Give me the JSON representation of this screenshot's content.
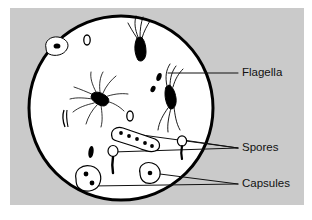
{
  "figure": {
    "background_color": "#cacaca",
    "field_color": "#ffffff",
    "ink_color": "#000000",
    "field": {
      "shape": "circle",
      "center_x": 121,
      "center_y": 108,
      "radius": 93,
      "stroke_width": 3
    }
  },
  "labels": [
    {
      "id": "flagella",
      "text": "Flagella",
      "x": 242,
      "y": 73,
      "leaders": [
        {
          "from_x": 238,
          "from_y": 73,
          "to_x": 168,
          "to_y": 73
        }
      ]
    },
    {
      "id": "spores",
      "text": "Spores",
      "x": 242,
      "y": 148,
      "leaders": [
        {
          "from_x": 238,
          "from_y": 148,
          "to_x": 183,
          "to_y": 140
        },
        {
          "from_x": 238,
          "from_y": 148,
          "to_x": 113,
          "to_y": 152
        },
        {
          "from_x": 238,
          "from_y": 148,
          "to_x": 123,
          "to_y": 131
        }
      ]
    },
    {
      "id": "capsules",
      "text": "Capsules",
      "x": 242,
      "y": 184,
      "leaders": [
        {
          "from_x": 238,
          "from_y": 184,
          "to_x": 152,
          "to_y": 173
        },
        {
          "from_x": 238,
          "from_y": 184,
          "to_x": 90,
          "to_y": 185
        }
      ]
    }
  ],
  "specimens": [
    {
      "id": "capsule-upper-left",
      "kind": "capsule",
      "cx": 56,
      "cy": 45
    },
    {
      "id": "spore-ring-upper",
      "kind": "free-spore",
      "cx": 87,
      "cy": 40
    },
    {
      "id": "bacillus-lophotrichous",
      "kind": "flagellated-rod",
      "cx": 140,
      "cy": 48
    },
    {
      "id": "bacillus-peritrichous",
      "kind": "flagellated-rod",
      "cx": 99,
      "cy": 98
    },
    {
      "id": "bacillus-amphitrichous",
      "kind": "flagellated-rod",
      "cx": 170,
      "cy": 95
    },
    {
      "id": "coccus-small-upper",
      "kind": "dark-rod",
      "cx": 158,
      "cy": 77
    },
    {
      "id": "coccus-small-lower",
      "kind": "dark-rod",
      "cx": 153,
      "cy": 88
    },
    {
      "id": "spore-ring-mid",
      "kind": "free-spore",
      "cx": 130,
      "cy": 115
    },
    {
      "id": "sporangium-chain",
      "kind": "spore-chain",
      "cx": 135,
      "cy": 137
    },
    {
      "id": "rod-left-thin",
      "kind": "dark-rod",
      "cx": 65,
      "cy": 118
    },
    {
      "id": "rod-lower-dark",
      "kind": "dark-rod",
      "cx": 91,
      "cy": 152
    },
    {
      "id": "terminal-spore-center",
      "kind": "terminal-spore-rod",
      "cx": 113,
      "cy": 152
    },
    {
      "id": "terminal-spore-right",
      "kind": "terminal-spore-rod",
      "cx": 182,
      "cy": 142
    },
    {
      "id": "capsule-diplo-lower-left",
      "kind": "capsule-double",
      "cx": 89,
      "cy": 180
    },
    {
      "id": "capsule-lower-right",
      "kind": "capsule",
      "cx": 150,
      "cy": 173
    }
  ]
}
